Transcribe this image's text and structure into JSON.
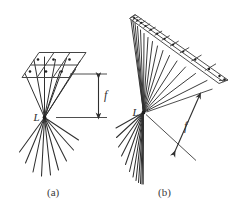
{
  "figure": {
    "domain": "diagram",
    "background_color": "#ffffff",
    "ink_color": "#2f2f2f",
    "grid_color": "#555555",
    "width": 234,
    "height": 212,
    "panels": [
      {
        "id": "a",
        "caption": "(a)",
        "source_label": "L",
        "distance_label": "f",
        "description": "Point source L with rays converging to a subdivided parallelogram plane above and diverging rays below; focal distance f shown by a vertical double-headed arrow between two horizontal reference lines.",
        "plane": {
          "shape": "parallelogram",
          "columns": 3,
          "rows": 2,
          "sample_dots": 6
        },
        "rays_up": 8,
        "rays_down": 9,
        "arrow": {
          "orientation": "vertical",
          "double_headed": true,
          "label": "f"
        },
        "reference_lines": 2
      },
      {
        "id": "b",
        "caption": "(b)",
        "source_label": "L",
        "distance_label": "f",
        "description": "Point source L with rays converging to a long slanted strip subdivided into many cells seen in steep perspective; a diverging fan of rays below; focal distance f shown by an oblique double-headed arrow normal to the strip.",
        "plane": {
          "shape": "elongated-strip",
          "columns": 14,
          "rows": 1,
          "sample_dots": 13
        },
        "rays_up": 15,
        "rays_down": 12,
        "arrow": {
          "orientation": "oblique",
          "double_headed": true,
          "label": "f"
        },
        "reference_lines": 2
      }
    ]
  }
}
